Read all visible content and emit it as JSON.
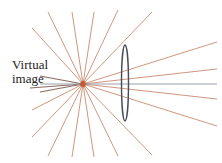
{
  "diagram": {
    "label_line1": "Virtual",
    "label_line2": "image",
    "colors": {
      "ray": "#c98a70",
      "ray_dark": "#8a6a60",
      "axis": "#9aa0a8",
      "lens": "#4a4e58",
      "focus": "#c0502a",
      "background": "#ffffff"
    },
    "center": [
      83,
      84
    ],
    "lens": {
      "cx": 125,
      "cy": 83,
      "rx": 3.5,
      "ry": 38
    },
    "rays": [
      {
        "x": 217,
        "y": 42
      },
      {
        "x": 217,
        "y": 69
      },
      {
        "x": 217,
        "y": 99
      },
      {
        "x": 217,
        "y": 126
      },
      {
        "x": 152,
        "y": 12
      },
      {
        "x": 118,
        "y": 10
      },
      {
        "x": 94,
        "y": 12
      },
      {
        "x": 72,
        "y": 12
      },
      {
        "x": 48,
        "y": 12
      },
      {
        "x": 32,
        "y": 28
      },
      {
        "x": 32,
        "y": 110
      },
      {
        "x": 32,
        "y": 137
      },
      {
        "x": 48,
        "y": 156
      },
      {
        "x": 72,
        "y": 157
      },
      {
        "x": 94,
        "y": 157
      },
      {
        "x": 118,
        "y": 156
      },
      {
        "x": 152,
        "y": 155
      },
      {
        "x": 40,
        "y": 76
      },
      {
        "x": 40,
        "y": 92
      },
      {
        "x": 30,
        "y": 88
      }
    ],
    "axis": {
      "x1": 40,
      "y1": 84,
      "x2": 217,
      "y2": 84
    }
  }
}
